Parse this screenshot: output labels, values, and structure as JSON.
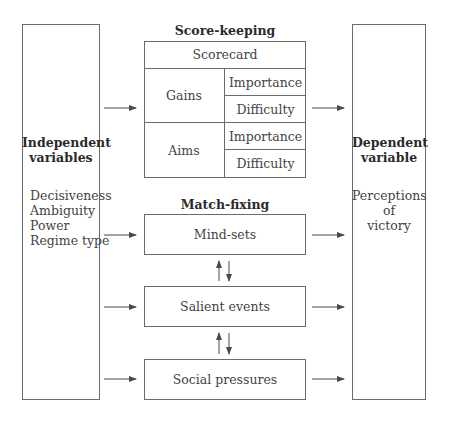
{
  "left": {
    "title_line1": "Independent",
    "title_line2": "variables",
    "items": [
      "Decisiveness",
      "Ambiguity",
      "Power",
      "Regime type"
    ]
  },
  "right": {
    "title_line1": "Dependent",
    "title_line2": "variable",
    "text_line1": "Perceptions",
    "text_line2": "of",
    "text_line3": "victory"
  },
  "score_keeping": {
    "heading": "Score-keeping",
    "header_cell": "Scorecard",
    "rows": [
      {
        "label": "Gains",
        "sub": [
          "Importance",
          "Difficulty"
        ]
      },
      {
        "label": "Aims",
        "sub": [
          "Importance",
          "Difficulty"
        ]
      }
    ]
  },
  "match_fixing": {
    "heading": "Match-fixing",
    "boxes": [
      "Mind-sets",
      "Salient events",
      "Social pressures"
    ]
  },
  "colors": {
    "line": "#6b6b6b",
    "text": "#3a3a3a",
    "arrow": "#4a4a4a"
  }
}
